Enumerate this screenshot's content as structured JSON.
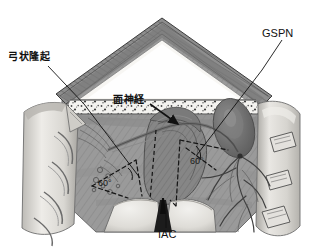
{
  "figure": {
    "background_color": "#ffffff",
    "labels": {
      "arcuate_eminence": "弓状隆起",
      "gspn": "GSPN",
      "facial_nerve": "面神経",
      "iac": "IAC",
      "angle_left": "60°",
      "angle_right": "60°"
    },
    "colors": {
      "background": "#ffffff",
      "ink": "#111111",
      "floor_gray": "#9a9a9a",
      "floor_gray_dark": "#808080",
      "bone_light": "#d8d8d4",
      "bone_highlight": "#eceae6",
      "roof_gray": "#8c8c8c",
      "speckle_band": "#f2f1ee",
      "vessel_dark": "#6f6f6f",
      "shadow": "#5e5e5e"
    },
    "annotations": {
      "angle_marker_count": 2,
      "angle_value": "60°",
      "dashed_line_style": "dashed"
    }
  }
}
